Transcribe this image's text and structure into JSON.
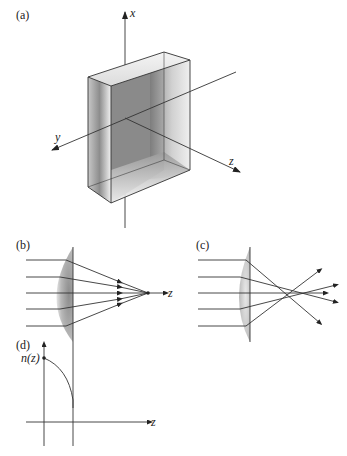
{
  "panels": {
    "a": {
      "label": "(a)",
      "axes": {
        "x": "x",
        "y": "y",
        "z": "z"
      },
      "description": "rectangular slab with graded index, 3D axes"
    },
    "b": {
      "label": "(b)",
      "axis": "z",
      "description": "plano-convex lens, rays converge to a single focus"
    },
    "c": {
      "label": "(c)",
      "description": "lens with spherical aberration, rays cross at different points"
    },
    "d": {
      "label": "(d)",
      "curve_label": "n(z)",
      "axis": "z",
      "description": "refractive index profile n(z) decreasing to slab edge"
    }
  },
  "colors": {
    "line": "#333333",
    "shade_dark": "#8a8a8a",
    "shade_light": "#e6e6e6",
    "background": "#ffffff"
  }
}
